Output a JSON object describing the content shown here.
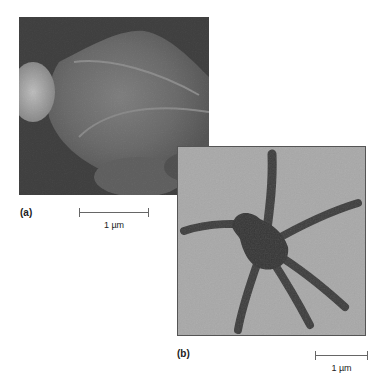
{
  "figure": {
    "panels": [
      {
        "id": "a",
        "label": "(a)",
        "description": "Scanning electron micrograph, dark background with large rounded textured structure",
        "scale_bar": "1 µm"
      },
      {
        "id": "b",
        "label": "(b)",
        "description": "Transmission micrograph of dark star-shaped body with six slender arms on light grey background",
        "scale_bar": "1 µm"
      }
    ]
  }
}
